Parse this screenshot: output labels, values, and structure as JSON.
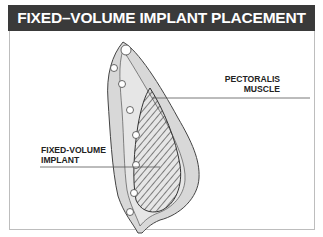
{
  "title": "FIXED–VOLUME IMPLANT PLACEMENT",
  "labels": {
    "pectoralis_line1": "PECTORALIS",
    "pectoralis_line2": "MUSCLE",
    "implant_line1": "FIXED-VOLUME",
    "implant_line2": "IMPLANT"
  },
  "colors": {
    "title_bg": "#3a3a3a",
    "title_text": "#ffffff",
    "frame_border": "#bdbdbd"
  }
}
